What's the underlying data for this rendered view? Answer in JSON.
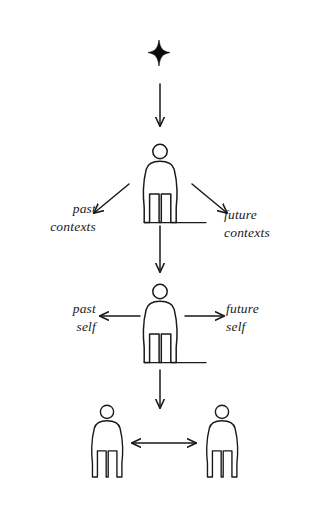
{
  "diagram": {
    "background_color": "#ffffff",
    "stroke_color": "#1a1a1a",
    "star": {
      "icon": "four-pointed-star-icon",
      "fill": "#000000",
      "cx": 159,
      "cy": 53,
      "half_width": 11,
      "half_height": 13
    },
    "labels": {
      "past_contexts": {
        "line1": "past",
        "line2": "contexts"
      },
      "future_contexts": {
        "line1": "future",
        "line2": "contexts"
      },
      "past_self": {
        "line1": "past",
        "line2": "self"
      },
      "future_self": {
        "line1": "future",
        "line2": "self"
      }
    },
    "figures": [
      {
        "name": "person-figure-top",
        "cx": 160,
        "top": 143,
        "scale": 1.0,
        "ground_line": true
      },
      {
        "name": "person-figure-middle",
        "cx": 160,
        "top": 283,
        "scale": 1.0,
        "ground_line": true
      },
      {
        "name": "person-figure-bottom-left",
        "cx": 107,
        "top": 404,
        "scale": 0.92,
        "ground_line": false
      },
      {
        "name": "person-figure-bottom-right",
        "cx": 222,
        "top": 404,
        "scale": 0.92,
        "ground_line": false
      }
    ],
    "arrows": [
      {
        "name": "arrow-star-to-top-figure",
        "direction": "down",
        "x1": 160,
        "y1": 84,
        "x2": 160,
        "y2": 126
      },
      {
        "name": "arrow-top-figure-to-past-contexts",
        "direction": "down-left",
        "x1": 129,
        "y1": 184,
        "x2": 93,
        "y2": 213
      },
      {
        "name": "arrow-top-figure-to-future-contexts",
        "direction": "down-right",
        "x1": 191,
        "y1": 184,
        "x2": 228,
        "y2": 213
      },
      {
        "name": "arrow-top-figure-to-middle-figure",
        "direction": "down",
        "x1": 160,
        "y1": 226,
        "x2": 160,
        "y2": 272
      },
      {
        "name": "arrow-middle-figure-to-past-self",
        "direction": "left",
        "x1": 139,
        "y1": 316,
        "x2": 99,
        "y2": 316
      },
      {
        "name": "arrow-middle-figure-to-future-self",
        "direction": "right",
        "x1": 186,
        "y1": 316,
        "x2": 225,
        "y2": 316
      },
      {
        "name": "arrow-middle-figure-to-bottom-pair",
        "direction": "down",
        "x1": 160,
        "y1": 370,
        "x2": 160,
        "y2": 408
      },
      {
        "name": "arrow-bottom-left-to-bottom-right",
        "direction": "both",
        "x1": 131,
        "y1": 443,
        "x2": 197,
        "y2": 443
      }
    ]
  }
}
